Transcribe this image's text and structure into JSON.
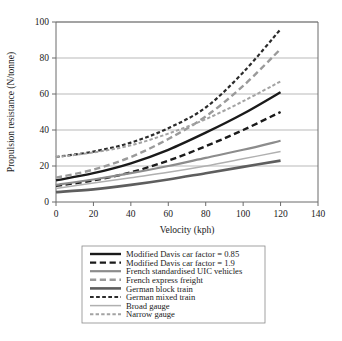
{
  "chart_data": {
    "type": "line",
    "title": "",
    "xlabel": "Velocity (kph)",
    "ylabel": "Propulsion resistance (N/tonne)",
    "xlim": [
      0,
      140
    ],
    "ylim": [
      0,
      100
    ],
    "xticks": [
      0,
      20,
      40,
      60,
      80,
      100,
      120,
      140
    ],
    "yticks": [
      0,
      20,
      40,
      60,
      80,
      100
    ],
    "grid": "horizontal",
    "legend_position": "below",
    "x": [
      0,
      20,
      40,
      60,
      80,
      100,
      120
    ],
    "series": [
      {
        "name": "Modified Davis car factor = 0.85",
        "color": "#1a1a1a",
        "dash": "solid",
        "width": 2.4,
        "values": [
          12.0,
          16.0,
          21.5,
          29.0,
          38.5,
          49.0,
          61.0
        ]
      },
      {
        "name": "Modified Davis car factor = 1.9",
        "color": "#1a1a1a",
        "dash": "dashed",
        "width": 2.4,
        "values": [
          9.0,
          12.0,
          16.5,
          23.0,
          31.0,
          40.0,
          50.0
        ]
      },
      {
        "name": "French standardised UIC vehicles",
        "color": "#8c8c8c",
        "dash": "solid",
        "width": 2.2,
        "values": [
          9.5,
          12.5,
          16.0,
          20.0,
          24.5,
          29.0,
          34.0
        ]
      },
      {
        "name": "French express freight",
        "color": "#9a9a9a",
        "dash": "dashed",
        "width": 2.4,
        "values": [
          13.5,
          18.0,
          25.0,
          35.0,
          47.5,
          64.5,
          85.0
        ]
      },
      {
        "name": "German block train",
        "color": "#5e5e5e",
        "dash": "solid",
        "width": 2.6,
        "values": [
          5.5,
          7.0,
          9.5,
          12.5,
          16.0,
          19.5,
          23.0
        ]
      },
      {
        "name": "German mixed train",
        "color": "#2b2b2b",
        "dash": "dotted",
        "width": 2.2,
        "values": [
          25.0,
          28.0,
          33.0,
          41.0,
          52.5,
          72.0,
          96.0
        ]
      },
      {
        "name": "Broad gauge",
        "color": "#b0b0b0",
        "dash": "solid",
        "width": 1.5,
        "values": [
          7.5,
          10.5,
          13.5,
          16.5,
          20.0,
          24.0,
          28.0
        ]
      },
      {
        "name": "Narrow gauge",
        "color": "#a3a3a3",
        "dash": "dotted",
        "width": 2.0,
        "values": [
          25.0,
          27.5,
          31.5,
          38.0,
          46.0,
          56.0,
          67.0
        ]
      }
    ]
  }
}
